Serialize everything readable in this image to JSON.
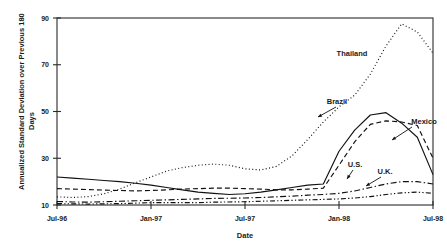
{
  "chart_data": {
    "type": "line",
    "title": "",
    "xlabel": "Date",
    "ylabel": "Annualized Standard Deviation over Previous 180 Days",
    "xlim": [
      0,
      24
    ],
    "ylim": [
      10,
      90
    ],
    "yticks": [
      10,
      30,
      50,
      70,
      90
    ],
    "xticks": [
      0,
      6,
      12,
      18,
      24
    ],
    "xticklabels": [
      "Jul-96",
      "Jan-97",
      "Jul-97",
      "Jan-98",
      "Jul-98"
    ],
    "grid": false,
    "legend": "inline-annotations",
    "x_months": [
      0,
      1,
      2,
      3,
      4,
      5,
      6,
      7,
      8,
      9,
      10,
      11,
      12,
      13,
      14,
      15,
      16,
      17,
      18,
      19,
      20,
      21,
      22,
      23,
      24
    ],
    "series": [
      {
        "name": "Thailand",
        "style": "dotted",
        "values": [
          13.5,
          13.2,
          13.6,
          14.8,
          16.8,
          19.5,
          22.0,
          24.5,
          26.0,
          27.0,
          27.5,
          27.0,
          25.5,
          25.0,
          26.5,
          31.0,
          38.0,
          45.5,
          52.0,
          57.0,
          66.0,
          78.0,
          87.5,
          84.0,
          75.0
        ]
      },
      {
        "name": "Brazil",
        "style": "solid",
        "values": [
          22.0,
          21.5,
          21.0,
          20.5,
          20.0,
          19.3,
          18.5,
          17.5,
          16.5,
          15.5,
          15.0,
          14.5,
          14.8,
          15.5,
          16.5,
          17.5,
          18.5,
          19.0,
          33.0,
          42.0,
          48.5,
          49.5,
          45.0,
          39.0,
          23.0
        ]
      },
      {
        "name": "Mexico",
        "style": "dashed",
        "values": [
          17.0,
          16.8,
          16.6,
          16.4,
          16.2,
          16.0,
          16.2,
          16.5,
          16.8,
          17.0,
          17.2,
          17.2,
          17.0,
          16.8,
          16.5,
          16.5,
          16.8,
          17.2,
          27.0,
          37.0,
          44.5,
          46.0,
          45.5,
          44.0,
          30.0
        ]
      },
      {
        "name": "U.S.",
        "style": "dashdot",
        "values": [
          11.5,
          11.3,
          11.2,
          11.4,
          11.6,
          11.8,
          12.0,
          12.2,
          12.4,
          12.6,
          12.8,
          12.9,
          13.0,
          13.2,
          13.5,
          13.8,
          14.2,
          14.5,
          15.0,
          16.0,
          17.5,
          19.0,
          20.0,
          20.0,
          19.0
        ]
      },
      {
        "name": "U.K.",
        "style": "dashdotdot",
        "values": [
          10.6,
          10.5,
          10.4,
          10.5,
          10.6,
          10.8,
          11.0,
          11.0,
          11.0,
          11.0,
          11.2,
          11.3,
          11.4,
          11.6,
          11.8,
          12.0,
          12.2,
          12.4,
          12.6,
          13.0,
          13.6,
          14.5,
          15.2,
          15.5,
          15.0
        ]
      }
    ],
    "annotations": [
      {
        "text": "Thailand",
        "series": "Thailand"
      },
      {
        "text": "Brazil",
        "series": "Brazil"
      },
      {
        "text": "Mexico",
        "series": "Mexico"
      },
      {
        "text": "U.S.",
        "series": "U.S."
      },
      {
        "text": "U.K.",
        "series": "U.K."
      }
    ]
  }
}
